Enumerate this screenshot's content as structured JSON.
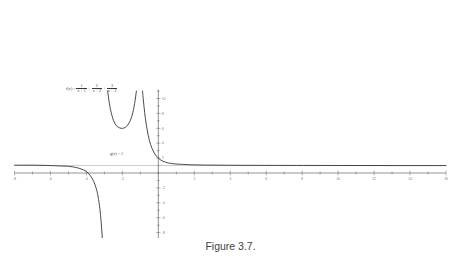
{
  "figure": {
    "caption": "Figure 3.7.",
    "function_label": {
      "lhs": "f(x) =",
      "terms": [
        {
          "numerator": "1",
          "denominator": "x + 1",
          "operator": ""
        },
        {
          "numerator": "2",
          "denominator": "x + 2",
          "operator": "+"
        },
        {
          "numerator": "3",
          "denominator": "x + 3",
          "operator": "+"
        }
      ]
    },
    "asymptote_label": "g(x) = 1"
  },
  "chart_data": {
    "type": "line",
    "title": "",
    "subtitle": "",
    "xlabel": "",
    "ylabel": "",
    "xlim": [
      -8,
      16
    ],
    "ylim": [
      -10,
      10
    ],
    "grid": false,
    "legend_position": "none",
    "x_ticks": [
      -8,
      -7,
      -6,
      -5,
      -4,
      -3,
      -2,
      -1,
      0,
      1,
      2,
      3,
      4,
      5,
      6,
      7,
      8,
      9,
      10,
      11,
      12,
      13,
      14,
      15,
      16
    ],
    "x_tick_labels": [
      "-8",
      "",
      "-6",
      "",
      "-4",
      "",
      "-2",
      "",
      "",
      "",
      "2",
      "",
      "4",
      "",
      "6",
      "",
      "8",
      "",
      "10",
      "",
      "12",
      "",
      "14",
      "",
      "16"
    ],
    "y_ticks": [
      -10,
      -8,
      -6,
      -4,
      -2,
      2,
      4,
      6,
      8,
      10
    ],
    "y_tick_labels": [
      "-10",
      "-8",
      "-6",
      "-4",
      "-2",
      "2",
      "4",
      "6",
      "8",
      "10"
    ],
    "annotations": [
      {
        "text": "f(x) = 1/(x+1) + 2/(x+2) + 3/(x+3)",
        "x": -3.6,
        "y": 5.1
      },
      {
        "text": "g(x) = 1",
        "x": -1.5,
        "y": 1.6
      }
    ],
    "series": [
      {
        "name": "f(x) = 1/(x+1) + 2/(x+2) + 3/(x+3)",
        "color": "#2b2b2b",
        "vertical_asymptotes": [
          -3,
          -2,
          -1
        ],
        "horizontal_asymptote": 1,
        "branches": [
          {
            "name": "left-branch",
            "domain": [
              -8,
              -3
            ],
            "description": "approaches y=1 from above at x=-8, decreases to -infinity as x approaches -3 from the left",
            "points": [
              {
                "x": -8.0,
                "y": 1.05
              },
              {
                "x": -7.0,
                "y": 1.05
              },
              {
                "x": -6.0,
                "y": 1.0
              },
              {
                "x": -5.5,
                "y": 0.95
              },
              {
                "x": -5.0,
                "y": 0.9
              },
              {
                "x": -4.6,
                "y": 0.75
              },
              {
                "x": -4.3,
                "y": 0.55
              },
              {
                "x": -4.0,
                "y": 0.2
              },
              {
                "x": -3.8,
                "y": -0.3
              },
              {
                "x": -3.6,
                "y": -1.1
              },
              {
                "x": -3.45,
                "y": -2.1
              },
              {
                "x": -3.35,
                "y": -3.2
              },
              {
                "x": -3.25,
                "y": -4.8
              },
              {
                "x": -3.18,
                "y": -6.6
              },
              {
                "x": -3.12,
                "y": -8.6
              },
              {
                "x": -3.08,
                "y": -10.5
              }
            ]
          },
          {
            "name": "middle-branch",
            "domain": [
              -3,
              -1
            ],
            "description": "U-shaped branch rising to +infinity at both x=-3 and x=-1, minimum near y=6 at x=-2",
            "points": [
              {
                "x": -2.82,
                "y": 11.0
              },
              {
                "x": -2.72,
                "y": 9.3
              },
              {
                "x": -2.62,
                "y": 8.1
              },
              {
                "x": -2.5,
                "y": 7.1
              },
              {
                "x": -2.35,
                "y": 6.4
              },
              {
                "x": -2.15,
                "y": 6.05
              },
              {
                "x": -2.0,
                "y": 6.0
              },
              {
                "x": -1.85,
                "y": 6.1
              },
              {
                "x": -1.7,
                "y": 6.45
              },
              {
                "x": -1.55,
                "y": 7.1
              },
              {
                "x": -1.42,
                "y": 8.1
              },
              {
                "x": -1.32,
                "y": 9.3
              },
              {
                "x": -1.22,
                "y": 11.0
              }
            ]
          },
          {
            "name": "right-branch",
            "domain": [
              -1,
              16
            ],
            "description": "descends from +infinity at x=-1 and flattens toward the horizontal asymptote y=1",
            "points": [
              {
                "x": -0.88,
                "y": 11.0
              },
              {
                "x": -0.8,
                "y": 9.0
              },
              {
                "x": -0.72,
                "y": 7.3
              },
              {
                "x": -0.62,
                "y": 5.8
              },
              {
                "x": -0.5,
                "y": 4.4
              },
              {
                "x": -0.35,
                "y": 3.3
              },
              {
                "x": -0.15,
                "y": 2.4
              },
              {
                "x": 0.1,
                "y": 1.8
              },
              {
                "x": 0.4,
                "y": 1.45
              },
              {
                "x": 0.8,
                "y": 1.25
              },
              {
                "x": 1.4,
                "y": 1.15
              },
              {
                "x": 2.2,
                "y": 1.08
              },
              {
                "x": 3.5,
                "y": 1.05
              },
              {
                "x": 5.0,
                "y": 1.03
              },
              {
                "x": 7.0,
                "y": 1.02
              },
              {
                "x": 10.0,
                "y": 1.01
              },
              {
                "x": 13.0,
                "y": 1.0
              },
              {
                "x": 16.0,
                "y": 1.0
              }
            ]
          }
        ]
      },
      {
        "name": "g(x) = 1",
        "color": "#9a9a9a",
        "type": "horizontal-asymptote",
        "value": 1,
        "x_range": [
          -8,
          16
        ]
      }
    ]
  }
}
